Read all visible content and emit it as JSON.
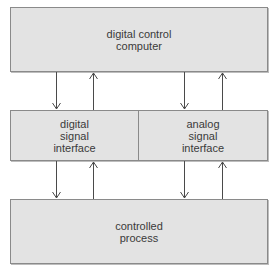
{
  "diagram": {
    "top_box": {
      "label": "digital control\ncomputer"
    },
    "middle_left_box": {
      "label": "digital\nsignal\ninterface"
    },
    "middle_right_box": {
      "label": "analog\nsignal\ninterface"
    },
    "bottom_box": {
      "label": "controlled\nprocess"
    },
    "colors": {
      "box_fill": "#e3e3e3",
      "box_border": "#8a8a8a",
      "line": "#4a4a4a",
      "text": "#3a3a3a"
    },
    "arrows": [
      {
        "from": "digital control computer",
        "to": "digital signal interface",
        "direction": "down"
      },
      {
        "from": "digital signal interface",
        "to": "digital control computer",
        "direction": "up"
      },
      {
        "from": "digital control computer",
        "to": "analog signal interface",
        "direction": "down"
      },
      {
        "from": "analog signal interface",
        "to": "digital control computer",
        "direction": "up"
      },
      {
        "from": "digital signal interface",
        "to": "controlled process",
        "direction": "down"
      },
      {
        "from": "controlled process",
        "to": "digital signal interface",
        "direction": "up"
      },
      {
        "from": "analog signal interface",
        "to": "controlled process",
        "direction": "down"
      },
      {
        "from": "controlled process",
        "to": "analog signal interface",
        "direction": "up"
      }
    ]
  }
}
